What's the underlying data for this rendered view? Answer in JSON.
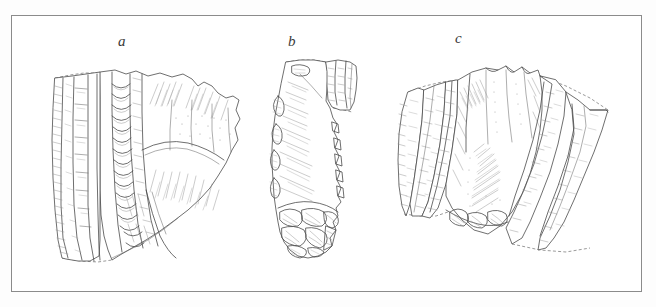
{
  "figure": {
    "kind": "archaeological-line-drawing-plate",
    "medium": "ink line drawing with stipple and hatching",
    "background_color": "#ffffff",
    "frame_color": "#8b8b8b",
    "ink_color": "#4a4a4a",
    "hatch_color": "#8d8d8d",
    "frame": {
      "x": 11,
      "y": 15,
      "width": 631,
      "height": 277
    },
    "specimens": [
      {
        "label": "a",
        "label_x": 118,
        "label_y": 33,
        "description": "broad blade core with long parallel blade-scar ridges on the left and scalloped flake removals across the centre; dashed reconstruction lines along the top and base",
        "bbox": [
          42,
          58,
          200,
          210
        ]
      },
      {
        "label": "b",
        "label_x": 288,
        "label_y": 33,
        "description": "narrow elongated core fragment with a detached blade segment at the upper right and a heavily retouched, scalloped base",
        "bbox": [
          270,
          55,
          90,
          205
        ]
      },
      {
        "label": "c",
        "label_x": 455,
        "label_y": 30,
        "description": "wide fan-shaped core with multiple vertical blade-scar facets and a crushed, scarred basal platform; dashed reconstruction outline on the right",
        "bbox": [
          398,
          62,
          225,
          190
        ]
      }
    ]
  }
}
